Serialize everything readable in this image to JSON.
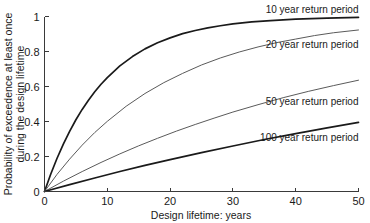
{
  "chart_data": {
    "type": "line",
    "title": "",
    "xlabel": "Design lifetime: years",
    "ylabel_line1": "Probability of exceedence at least once",
    "ylabel_line2": "during the design lifetime",
    "xlim": [
      0,
      50
    ],
    "ylim": [
      0,
      1
    ],
    "xticks": [
      0,
      10,
      20,
      30,
      40,
      50
    ],
    "yticks": [
      0,
      0.2,
      0.4,
      0.6,
      0.8,
      1
    ],
    "xtick_labels": [
      "0",
      "10",
      "20",
      "30",
      "40",
      "50"
    ],
    "ytick_labels": [
      "0",
      "0.2",
      "0.4",
      "0.6",
      "0.8",
      "1"
    ],
    "grid": false,
    "legend_position": "inline-annotations",
    "formula": "P = 1 - (1 - 1/T)^L",
    "series": [
      {
        "name": "10 year return period",
        "return_period": 10,
        "color": "#1a1a1a",
        "line_width": 1.7,
        "label_x": 50,
        "label_y": 1.0,
        "x": [
          0,
          1,
          2,
          3,
          4,
          5,
          6,
          7,
          8,
          9,
          10,
          12,
          14,
          16,
          18,
          20,
          22,
          24,
          26,
          28,
          30,
          33,
          36,
          40,
          45,
          50
        ],
        "values": [
          0,
          0.1,
          0.19,
          0.271,
          0.344,
          0.41,
          0.469,
          0.522,
          0.57,
          0.613,
          0.651,
          0.718,
          0.771,
          0.815,
          0.85,
          0.878,
          0.902,
          0.92,
          0.935,
          0.947,
          0.958,
          0.969,
          0.977,
          0.985,
          0.991,
          0.995
        ]
      },
      {
        "name": "20 year return period",
        "return_period": 20,
        "color": "#5a5a5a",
        "line_width": 1.0,
        "label_x": 50,
        "label_y": 0.8,
        "x": [
          0,
          2,
          4,
          6,
          8,
          10,
          13,
          16,
          19,
          22,
          25,
          28,
          31,
          34,
          37,
          40,
          43,
          46,
          50
        ],
        "values": [
          0,
          0.098,
          0.185,
          0.265,
          0.337,
          0.401,
          0.487,
          0.56,
          0.622,
          0.675,
          0.723,
          0.763,
          0.797,
          0.826,
          0.851,
          0.871,
          0.891,
          0.907,
          0.923
        ]
      },
      {
        "name": "50 year return period",
        "return_period": 50,
        "color": "#5a5a5a",
        "line_width": 1.0,
        "label_x": 50,
        "label_y": 0.47,
        "x": [
          0,
          3,
          6,
          9,
          12,
          15,
          18,
          21,
          24,
          27,
          30,
          34,
          38,
          42,
          46,
          50
        ],
        "values": [
          0,
          0.059,
          0.114,
          0.166,
          0.215,
          0.261,
          0.304,
          0.345,
          0.383,
          0.419,
          0.454,
          0.496,
          0.536,
          0.572,
          0.605,
          0.636
        ]
      },
      {
        "name": "100 year return period",
        "return_period": 100,
        "color": "#1a1a1a",
        "line_width": 1.7,
        "label_x": 50,
        "label_y": 0.265,
        "x": [
          0,
          4,
          8,
          12,
          16,
          20,
          25,
          30,
          35,
          40,
          45,
          50
        ],
        "values": [
          0,
          0.039,
          0.077,
          0.114,
          0.149,
          0.182,
          0.222,
          0.26,
          0.297,
          0.331,
          0.364,
          0.395
        ]
      }
    ]
  },
  "axes": {
    "x_axis_name": "x-axis",
    "y_axis_name": "y-axis"
  }
}
